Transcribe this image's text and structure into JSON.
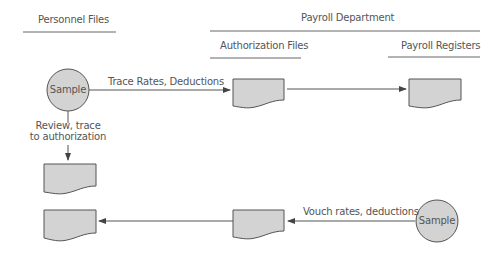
{
  "headers": {
    "personnel_files": "Personnel Files",
    "payroll_department": "Payroll Department",
    "authorization_files": "Authorization Files",
    "payroll_registers": "Payroll Registers"
  },
  "nodes": {
    "sample_top": "Sample",
    "sample_bottom": "Sample"
  },
  "edges": {
    "trace_rates": "Trace Rates, Deductions",
    "review_trace_line1": "Review, trace",
    "review_trace_line2": "to authorization",
    "vouch_rates": "Vouch rates, deductions"
  },
  "colors": {
    "fill": "#d3d3d3",
    "stroke": "#555555",
    "text": "#555555"
  }
}
